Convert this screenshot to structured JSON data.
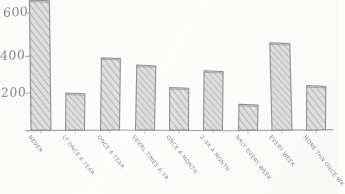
{
  "chart_data": {
    "type": "bar",
    "title": "",
    "subtitle": "",
    "xlabel": "",
    "ylabel": "",
    "style": "hand-drawn pencil sketch, hatched bars",
    "grid": false,
    "legend": null,
    "ylim": [
      0,
      650
    ],
    "y_ticks": [
      200,
      400,
      600
    ],
    "y_tick_labels": [
      "200",
      "400",
      "600"
    ],
    "note_top_bar_clipped": "first bar extends above the top of the visible plot area",
    "categories": [
      "NEVER",
      "LT ONCE A YEAR",
      "ONCE A YEAR",
      "SEVRL TIMES A YR",
      "ONCE A MONTH",
      "2-3X A MONTH",
      "NRLY EVERY WEEK",
      "EVERY WEEK",
      "MORE THN ONCE WK"
    ],
    "values": [
      700,
      200,
      390,
      350,
      230,
      320,
      140,
      470,
      240
    ]
  },
  "axis": {
    "y_tick_600": "600",
    "y_tick_400": "400",
    "y_tick_200": "200"
  },
  "colors": {
    "paper": "#fdfdfc",
    "pencil": "#8a8a8f",
    "pencil_dark": "#6e6e72",
    "bar_fill": "#d8d8d6",
    "hatch": "#9a9a9e"
  }
}
